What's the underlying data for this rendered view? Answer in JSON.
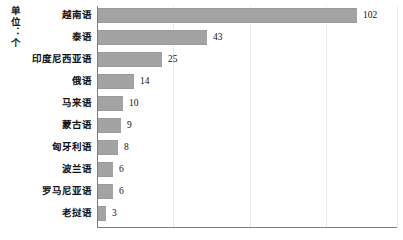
{
  "chart_data": {
    "type": "bar",
    "orientation": "horizontal",
    "title": "",
    "subtitle": "",
    "xlabel": "",
    "ylabel": "单位：个",
    "unit_label": "单位：个",
    "categories": [
      "越南语",
      "泰语",
      "印度尼西亚语",
      "俄语",
      "马来语",
      "蒙古语",
      "匈牙利语",
      "波兰语",
      "罗马尼亚语",
      "老挝语"
    ],
    "values": [
      102,
      43,
      25,
      14,
      10,
      9,
      8,
      6,
      6,
      3
    ],
    "value_labels": [
      "102",
      "43",
      "25",
      "14",
      "10",
      "9",
      "8",
      "6",
      "6",
      "3"
    ],
    "xlim": [
      0,
      118
    ],
    "gridlines": [
      30,
      60,
      90,
      118
    ],
    "grid": true,
    "grid_style": "dotted-vertical",
    "legend": false,
    "legend_position": "none",
    "bar_color": "#a3a3a3",
    "axis_color": "#7f7f7f",
    "grid_color": "#d8d8d8",
    "background_color": "#ffffff",
    "text_color": "#111111"
  }
}
